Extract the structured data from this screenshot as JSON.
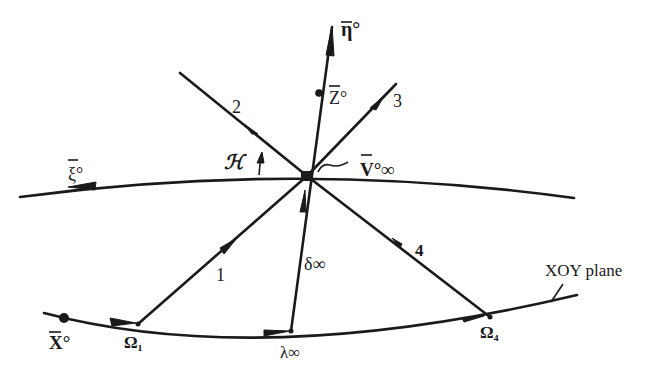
{
  "diagram": {
    "labels": {
      "eta": "η°",
      "z": "Z°",
      "ray2": "2",
      "ray3": "3",
      "kappa": "ℋ",
      "xi": "ξ°",
      "v_inf": "V°∞",
      "ray1": "1",
      "ray4": "4",
      "delta": "δ∞",
      "x": "X°",
      "omega1": "Ω₁",
      "lambda": "λ∞",
      "omega4": "Ω₄",
      "xoy_plane": "XOY plane"
    },
    "colors": {
      "ink": "#1a1a1a",
      "background": "#ffffff"
    }
  }
}
